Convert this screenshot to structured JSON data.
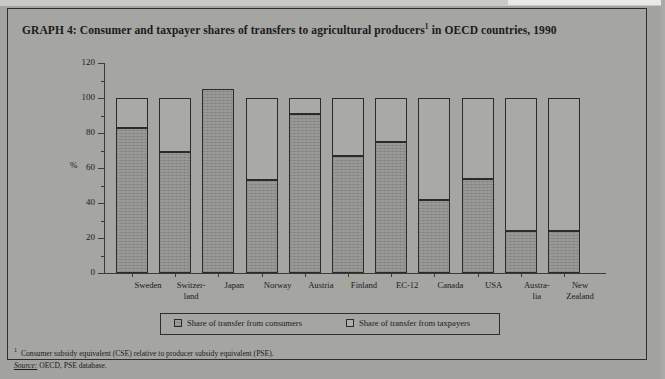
{
  "figure": {
    "title_prefix": "GRAPH 4: Consumer and taxpayer shares of transfers to agricultural producers",
    "title_footnote_marker": "1",
    "title_suffix": " in OECD countries, 1990"
  },
  "legend": {
    "consumers_label": "Share of transfer from consumers",
    "taxpayers_label": "Share of transfer from taxpayers"
  },
  "notes": {
    "footnote_marker": "1",
    "footnote_text": "Consumer subsidy equivalent (CSE) relative to producer subsidy equivalent (PSE).",
    "source_label": "Source:",
    "source_text": " OECD, PSE database."
  },
  "chart_data": {
    "type": "bar",
    "stacked": true,
    "xlabel": "",
    "ylabel": "%",
    "ylim": [
      0,
      120
    ],
    "yticks": [
      0,
      20,
      40,
      60,
      80,
      100,
      120
    ],
    "ytick_labels": [
      "0",
      "20",
      "40",
      "60",
      "80",
      "100",
      "120"
    ],
    "minor_tick_step": 10,
    "grid": false,
    "legend_position": "bottom",
    "categories": [
      "Sweden",
      "Switzer-\nland",
      "Japan",
      "Norway",
      "Austria",
      "Finland",
      "EC-12",
      "Canada",
      "USA",
      "Austra-\nlia",
      "New\nZealand"
    ],
    "category_lines": [
      [
        "Sweden"
      ],
      [
        "Switzer-",
        "land"
      ],
      [
        "Japan"
      ],
      [
        "Norway"
      ],
      [
        "Austria"
      ],
      [
        "Finland"
      ],
      [
        "EC-12"
      ],
      [
        "Canada"
      ],
      [
        "USA"
      ],
      [
        "Austra-",
        "lia"
      ],
      [
        "New",
        "Zealand"
      ]
    ],
    "series": [
      {
        "name": "Share of transfer from consumers",
        "values": [
          83,
          69,
          105,
          53,
          91,
          67,
          75,
          42,
          54,
          24,
          24
        ]
      },
      {
        "name": "Share of transfer from taxpayers",
        "values": [
          17,
          31,
          0,
          47,
          9,
          33,
          25,
          58,
          46,
          76,
          76
        ]
      }
    ],
    "totals": [
      100,
      100,
      105,
      100,
      100,
      100,
      100,
      100,
      100,
      100,
      100
    ]
  }
}
